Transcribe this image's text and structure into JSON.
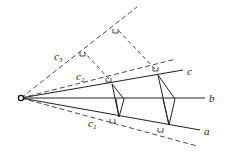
{
  "diagram": {
    "origin": {
      "x": 21,
      "y": 98
    },
    "solid_lines": [
      {
        "name": "a",
        "label": "a",
        "end": {
          "x": 200,
          "y": 130
        },
        "label_pos": {
          "x": 204,
          "y": 135
        }
      },
      {
        "name": "b",
        "label": "b",
        "end": {
          "x": 205,
          "y": 98
        },
        "label_pos": {
          "x": 209,
          "y": 102
        }
      },
      {
        "name": "c",
        "label": "c",
        "end": {
          "x": 183,
          "y": 70
        },
        "label_pos": {
          "x": 187,
          "y": 75
        }
      }
    ],
    "dashed_lines": [
      {
        "name": "c1",
        "label": "c",
        "sub": "1",
        "end": {
          "x": 197,
          "y": 146
        },
        "label_pos": {
          "x": 88,
          "y": 127
        }
      },
      {
        "name": "c2",
        "label": "c",
        "sub": "2",
        "end": {
          "x": 176,
          "y": 59
        },
        "label_pos": {
          "x": 76,
          "y": 80
        }
      },
      {
        "name": "c3",
        "label": "c",
        "sub": "3",
        "end": {
          "x": 137,
          "y": 7
        },
        "label_pos": {
          "x": 54,
          "y": 60
        }
      }
    ],
    "perpendiculars": [
      {
        "from": {
          "x": 109,
          "y": 79
        },
        "to": {
          "x": 84,
          "y": 52
        }
      },
      {
        "from": {
          "x": 155,
          "y": 69
        },
        "to": {
          "x": 117,
          "y": 29
        }
      }
    ],
    "quadrilaterals": [
      {
        "points": [
          [
            112,
            84
          ],
          [
            124,
            99
          ],
          [
            119,
            117
          ],
          [
            112,
            84
          ]
        ],
        "center_line": [
          [
            116,
            99
          ],
          [
            119,
            117
          ]
        ]
      },
      {
        "points": [
          [
            158,
            75
          ],
          [
            175,
            99
          ],
          [
            169,
            125
          ],
          [
            158,
            75
          ]
        ],
        "center_line": [
          [
            163,
            99
          ],
          [
            169,
            125
          ]
        ]
      }
    ],
    "right_angle_marks": [
      {
        "x": 84,
        "y": 52
      },
      {
        "x": 117,
        "y": 29
      },
      {
        "x": 110,
        "y": 78
      },
      {
        "x": 157,
        "y": 67
      },
      {
        "x": 114,
        "y": 119
      },
      {
        "x": 162,
        "y": 128
      }
    ],
    "colors": {
      "stroke": "#222222",
      "dashed": "#333333"
    }
  }
}
